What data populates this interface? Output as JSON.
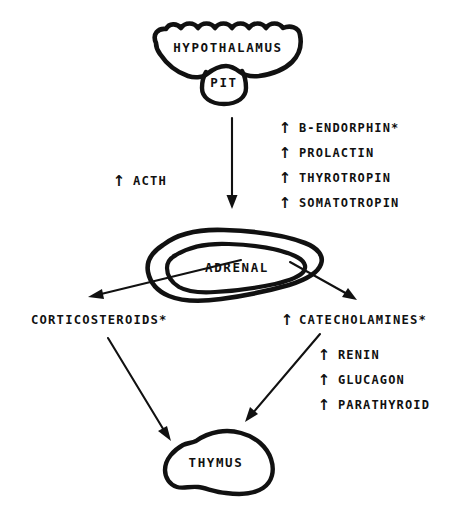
{
  "figure": {
    "background_color": "#ffffff",
    "ink_color": "#111111",
    "type": "hand-drawn flow diagram",
    "up_arrow_glyph": "↑"
  },
  "nodes": {
    "hypothalamus": {
      "label": "HYPOTHALAMUS",
      "shape": "scalloped-gland-outline"
    },
    "pituitary": {
      "label": "PIT",
      "shape": "pouch-outline"
    },
    "adrenal": {
      "label": "ADRENAL",
      "shape": "double-contour-gland-outline"
    },
    "thymus": {
      "label": "THYMUS",
      "shape": "blob-outline"
    }
  },
  "labels": {
    "acth": {
      "arrow": "↑",
      "text": "ACTH"
    },
    "corticosteroids": {
      "arrow": "",
      "text": "CORTICOSTEROIDS*"
    },
    "catecholamines": {
      "arrow": "↑",
      "text": "CATECHOLAMINES*"
    }
  },
  "pituitary_hormones": {
    "items": [
      {
        "arrow": "↑",
        "text": "B-ENDORPHIN*"
      },
      {
        "arrow": "↑",
        "text": "PROLACTIN"
      },
      {
        "arrow": "↑",
        "text": "THYROTROPIN"
      },
      {
        "arrow": "↑",
        "text": "SOMATOTROPIN"
      }
    ]
  },
  "catecholamine_associated": {
    "items": [
      {
        "arrow": "↑",
        "text": "RENIN"
      },
      {
        "arrow": "↑",
        "text": "GLUCAGON"
      },
      {
        "arrow": "↑",
        "text": "PARATHYROID"
      }
    ]
  },
  "connections": [
    {
      "from": "pituitary",
      "to": "adrenal",
      "direction": "down"
    },
    {
      "from": "adrenal",
      "to": "corticosteroids",
      "direction": "down-left"
    },
    {
      "from": "adrenal",
      "to": "catecholamines",
      "direction": "down-right"
    },
    {
      "from": "corticosteroids",
      "to": "thymus",
      "direction": "down-right"
    },
    {
      "from": "catecholamines",
      "to": "thymus",
      "direction": "down-left"
    }
  ]
}
